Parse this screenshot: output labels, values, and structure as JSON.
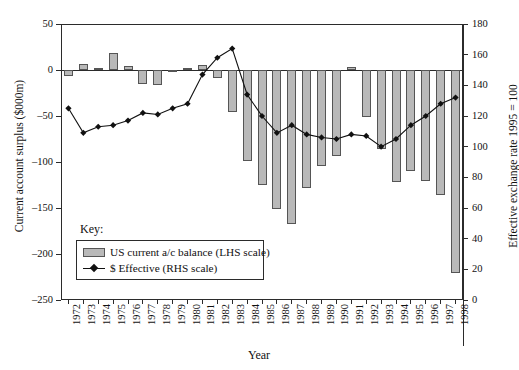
{
  "axes": {
    "left_title": "Current account surplus ($000m)",
    "right_title": "Effective exchange rate 1995 = 100",
    "x_title": "Year",
    "left_ticks": [
      "50",
      "0",
      "-50",
      "-100",
      "-150",
      "-200",
      "-250"
    ],
    "right_ticks": [
      "180",
      "160",
      "140",
      "120",
      "100",
      "80",
      "60",
      "40",
      "20",
      "0"
    ]
  },
  "legend": {
    "key_label": "Key:",
    "bar_label": "US current a/c balance (LHS scale)",
    "line_label": "$ Effective (RHS scale)"
  },
  "colors": {
    "bar_fill": "#b9b9b9",
    "bar_stroke": "#555555",
    "line": "#111111",
    "axis": "#2b2b2b"
  },
  "chart_data": {
    "type": "bar",
    "title": "",
    "xlabel": "Year",
    "ylabel": "Current account surplus ($000m)",
    "y2label": "Effective exchange rate 1995 = 100",
    "ylim": [
      -250,
      50
    ],
    "y2lim": [
      0,
      180
    ],
    "grid": false,
    "legend_position": "inside-lower-left",
    "categories": [
      "1972",
      "1973",
      "1974",
      "1975",
      "1976",
      "1977",
      "1978",
      "1979",
      "1980",
      "1981",
      "1982",
      "1983",
      "1984",
      "1985",
      "1986",
      "1987",
      "1988",
      "1989",
      "1990",
      "1991",
      "1992",
      "1993",
      "1994",
      "1995",
      "1996",
      "1997",
      "1998"
    ],
    "series": [
      {
        "name": "US current a/c balance (LHS scale)",
        "type": "bar",
        "axis": "left",
        "unit": "$000m",
        "values": [
          -6,
          7,
          2,
          18,
          4,
          -15,
          -16,
          -1,
          2,
          5,
          -9,
          -46,
          -99,
          -125,
          -151,
          -167,
          -128,
          -104,
          -94,
          3,
          -51,
          -86,
          -122,
          -110,
          -121,
          -136,
          -221
        ]
      },
      {
        "name": "$ Effective (RHS scale)",
        "type": "line",
        "axis": "right",
        "unit": "index 1995 = 100",
        "values": [
          125,
          109,
          113,
          114,
          117,
          122,
          121,
          125,
          128,
          147,
          158,
          164,
          134,
          120,
          109,
          114,
          108,
          106,
          105,
          108,
          107,
          100,
          105,
          114,
          120,
          128,
          132
        ]
      }
    ]
  }
}
